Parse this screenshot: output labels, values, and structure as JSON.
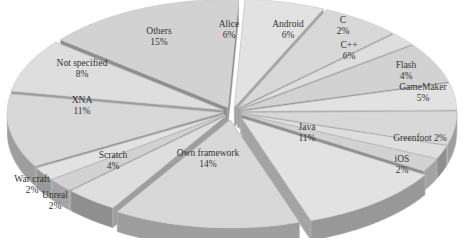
{
  "chart_data": {
    "type": "pie",
    "style": "3d-exploded",
    "title": "",
    "slices": [
      {
        "label": "Alice",
        "value": 6
      },
      {
        "label": "Android",
        "value": 6
      },
      {
        "label": "C",
        "value": 2
      },
      {
        "label": "C++",
        "value": 6
      },
      {
        "label": "Flash",
        "value": 4
      },
      {
        "label": "GameMaker",
        "value": 5
      },
      {
        "label": "Greenfoot",
        "value": 2
      },
      {
        "label": "iOS",
        "value": 2
      },
      {
        "label": "Java",
        "value": 11
      },
      {
        "label": "Own framework",
        "value": 14
      },
      {
        "label": "Scratch",
        "value": 4
      },
      {
        "label": "Unreal",
        "value": 2
      },
      {
        "label": "War craft",
        "value": 2
      },
      {
        "label": "XNA",
        "value": 11
      },
      {
        "label": "Not specified",
        "value": 8
      },
      {
        "label": "Others",
        "value": 15
      }
    ],
    "unit": "%",
    "legend": "none",
    "colors": {
      "top": "#dcdcdc",
      "side": "#9a9a9a",
      "text": "#333333"
    }
  },
  "labels": [
    {
      "name": "Alice",
      "pct": "6%",
      "x": 229,
      "y": 25
    },
    {
      "name": "Android",
      "pct": "6%",
      "x": 288,
      "y": 25
    },
    {
      "name": "C",
      "pct": "2%",
      "x": 343,
      "y": 21
    },
    {
      "name": "C++",
      "pct": "6%",
      "x": 349,
      "y": 46
    },
    {
      "name": "Flash",
      "pct": "4%",
      "x": 406,
      "y": 66
    },
    {
      "name": "GameMaker",
      "pct": "5%",
      "x": 423,
      "y": 88
    },
    {
      "name": "Greenfoot 2%",
      "pct": "",
      "x": 420,
      "y": 139
    },
    {
      "name": "iOS",
      "pct": "2%",
      "x": 402,
      "y": 160
    },
    {
      "name": "Java",
      "pct": "11%",
      "x": 307,
      "y": 128
    },
    {
      "name": "Own framework",
      "pct": "14%",
      "x": 208,
      "y": 154
    },
    {
      "name": "Scratch",
      "pct": "4%",
      "x": 113,
      "y": 156
    },
    {
      "name": "Unreal",
      "pct": "2%",
      "x": 55,
      "y": 196
    },
    {
      "name": "War craft",
      "pct": "2%",
      "x": 32,
      "y": 180
    },
    {
      "name": "XNA",
      "pct": "11%",
      "x": 82,
      "y": 101
    },
    {
      "name": "Not specified",
      "pct": "8%",
      "x": 82,
      "y": 64
    },
    {
      "name": "Others",
      "pct": "15%",
      "x": 159,
      "y": 32
    }
  ]
}
